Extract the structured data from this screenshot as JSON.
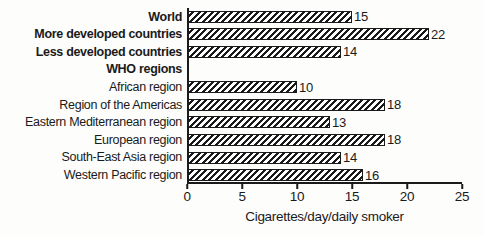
{
  "colors": {
    "ink": "#1a1a1a",
    "bar_fill": "#ffffff",
    "background": "#fdfdfc"
  },
  "chart_data": {
    "type": "bar",
    "orientation": "horizontal",
    "xlabel": "Cigarettes/day/daily smoker",
    "xlim": [
      0,
      25
    ],
    "xticks": [
      0,
      5,
      10,
      15,
      20,
      25
    ],
    "bar_style": "black diagonal hatch on white, black outline",
    "grid": false,
    "legend": false,
    "rows": [
      {
        "label": "World",
        "value": 15,
        "bold": true,
        "header": false
      },
      {
        "label": "More developed countries",
        "value": 22,
        "bold": true,
        "header": false
      },
      {
        "label": "Less developed countries",
        "value": 14,
        "bold": true,
        "header": false
      },
      {
        "label": "WHO regions",
        "value": null,
        "bold": true,
        "header": true
      },
      {
        "label": "African region",
        "value": 10,
        "bold": false,
        "header": false
      },
      {
        "label": "Region of the Americas",
        "value": 18,
        "bold": false,
        "header": false
      },
      {
        "label": "Eastern Mediterranean region",
        "value": 13,
        "bold": false,
        "header": false
      },
      {
        "label": "European region",
        "value": 18,
        "bold": false,
        "header": false
      },
      {
        "label": "South-East Asia region",
        "value": 14,
        "bold": false,
        "header": false
      },
      {
        "label": "Western Pacific region",
        "value": 16,
        "bold": false,
        "header": false
      }
    ]
  }
}
